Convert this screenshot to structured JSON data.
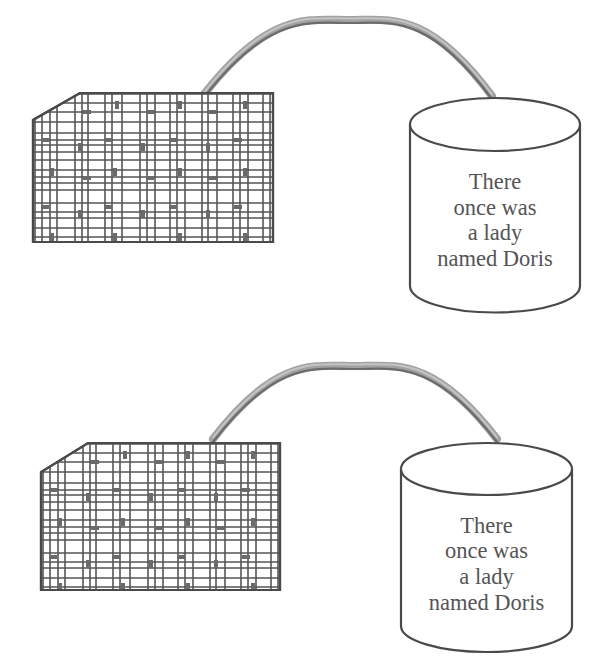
{
  "diagram": {
    "colors": {
      "line": "#4a4a4a",
      "grid": "#555555",
      "cable": "#a2a2a2",
      "cable_shadow": "#6c6c6c",
      "text": "#555555",
      "background": "#ffffff"
    },
    "units": [
      {
        "id": "top",
        "card": {
          "x": 33,
          "y": 93,
          "width": 240,
          "height": 149,
          "corner_cut": {
            "dx": 47,
            "dy": 27
          }
        },
        "cable": {
          "start": [
            205,
            93
          ],
          "peak": [
            350,
            20
          ],
          "end": [
            492,
            96
          ]
        },
        "cylinder": {
          "cx": 495,
          "top_cy": 124.5,
          "rx": 85,
          "ry": 26.5,
          "bottom_cy": 286
        },
        "label_lines": [
          "There",
          "once was",
          "a lady",
          "named Doris"
        ],
        "label_baselines": [
          189,
          215,
          240,
          266
        ]
      },
      {
        "id": "bottom",
        "card": {
          "x": 41,
          "y": 443,
          "width": 239,
          "height": 147,
          "corner_cut": {
            "dx": 47,
            "dy": 29
          }
        },
        "cable": {
          "start": [
            213,
            439
          ],
          "peak": [
            355,
            366
          ],
          "end": [
            497,
            439
          ]
        },
        "cylinder": {
          "cx": 486.5,
          "top_cy": 469,
          "rx": 85.5,
          "ry": 26,
          "bottom_cy": 626
        },
        "label_lines": [
          "There",
          "once was",
          "a lady",
          "named Doris"
        ],
        "label_baselines": [
          533,
          558,
          584,
          610
        ]
      }
    ],
    "card_grid": {
      "vertical_offsets": [
        2,
        9,
        17,
        24,
        42,
        49,
        55,
        72,
        79,
        89,
        107,
        114,
        122,
        137,
        144,
        152,
        169,
        175,
        184,
        200,
        207,
        215,
        230,
        237
      ],
      "horizontal_offsets": [
        1,
        10,
        19,
        29,
        40,
        47,
        52,
        59,
        67,
        77,
        84,
        90,
        97,
        110,
        119,
        125,
        135,
        144
      ],
      "vertical_marks": [
        [
          84,
          12
        ],
        [
          147,
          12
        ],
        [
          212,
          12
        ],
        [
          47,
          54
        ],
        [
          110,
          54
        ],
        [
          175,
          54
        ],
        [
          19,
          79
        ],
        [
          82,
          79
        ],
        [
          147,
          79
        ],
        [
          212,
          79
        ],
        [
          47,
          121
        ],
        [
          110,
          121
        ],
        [
          175,
          121
        ],
        [
          19,
          144
        ],
        [
          82,
          144
        ],
        [
          147,
          144
        ],
        [
          212,
          144
        ]
      ],
      "horizontal_marks": [
        [
          54,
          19
        ],
        [
          117,
          19
        ],
        [
          180,
          19
        ],
        [
          12,
          47
        ],
        [
          75,
          47
        ],
        [
          140,
          47
        ],
        [
          205,
          47
        ],
        [
          54,
          85
        ],
        [
          117,
          85
        ],
        [
          180,
          85
        ],
        [
          12,
          114
        ],
        [
          75,
          114
        ],
        [
          140,
          114
        ],
        [
          205,
          114
        ]
      ]
    }
  }
}
